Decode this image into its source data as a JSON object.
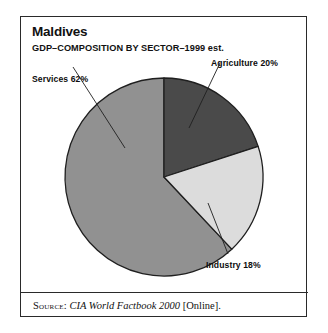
{
  "figure": {
    "title": "Maldives",
    "subtitle": "GDP–COMPOSITION BY SECTOR–1999 est.",
    "source": {
      "label": "Source:",
      "work": "CIA World Factbook 2000",
      "medium": "[Online]."
    },
    "frame_color": "#2a2a2a",
    "background": "#ffffff"
  },
  "labels": {
    "services": "Services 62%",
    "agriculture": "Agriculture 20%",
    "industry": "Industry 18%"
  },
  "chart_data": {
    "type": "pie",
    "title": "Maldives",
    "subtitle": "GDP–COMPOSITION BY SECTOR–1999 est.",
    "xlabel": "",
    "ylabel": "",
    "units": "percent",
    "total": 100,
    "start_angle_deg": 0,
    "direction": "clockwise",
    "legend_position": "none-callout-labels",
    "grid": false,
    "categories": [
      "Agriculture",
      "Industry",
      "Services"
    ],
    "values": [
      20,
      18,
      62
    ],
    "slices": [
      {
        "name": "Agriculture",
        "value": 20,
        "label": "Agriculture 20%",
        "color": "#4a4a4a",
        "start_deg": 0,
        "end_deg": 72
      },
      {
        "name": "Industry",
        "value": 18,
        "label": "Industry 18%",
        "color": "#dcdcdc",
        "start_deg": 72,
        "end_deg": 136.8
      },
      {
        "name": "Services",
        "value": 62,
        "label": "Services 62%",
        "color": "#919191",
        "start_deg": 136.8,
        "end_deg": 360
      }
    ]
  }
}
